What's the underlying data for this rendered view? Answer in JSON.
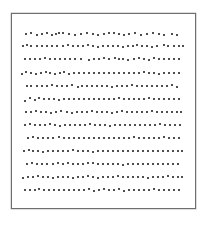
{
  "figure": {
    "frame": {
      "left": 11,
      "top": 13,
      "width": 183,
      "height": 194,
      "border_color": "#6e6e6e"
    },
    "dot_color": "#2b2b2b",
    "row_count": 13,
    "row_y": [
      33,
      45,
      58,
      72,
      85,
      98,
      111,
      124,
      137,
      150,
      163,
      176,
      189
    ],
    "rows": [
      {
        "x": [
          25,
          30,
          36,
          41,
          46,
          51,
          55,
          58,
          62,
          68,
          74,
          80,
          86,
          92,
          97,
          103,
          108,
          113,
          118,
          123,
          128,
          134,
          140,
          146,
          152,
          158,
          163,
          171,
          176
        ],
        "dy": [
          0,
          -1,
          1,
          0,
          -1,
          1,
          0,
          -1,
          -1,
          0,
          1,
          0,
          -1,
          0,
          1,
          0,
          -1,
          -1,
          0,
          1,
          0,
          -1,
          1,
          0,
          -1,
          0,
          1,
          0,
          1
        ]
      },
      {
        "x": [
          22,
          26,
          30,
          36,
          41,
          46,
          51,
          56,
          62,
          67,
          72,
          77,
          82,
          87,
          92,
          97,
          102,
          107,
          112,
          117,
          122,
          127,
          132,
          136,
          141,
          146,
          151,
          156,
          163,
          167,
          173,
          178,
          182
        ],
        "dy": [
          0,
          -1,
          0,
          0,
          0,
          0,
          0,
          0,
          0,
          -1,
          0,
          0,
          0,
          -1,
          0,
          1,
          0,
          0,
          0,
          0,
          1,
          0,
          0,
          -1,
          0,
          0,
          1,
          0,
          -1,
          0,
          0,
          0,
          0
        ]
      },
      {
        "x": [
          24,
          29,
          34,
          39,
          44,
          49,
          54,
          59,
          64,
          69,
          74,
          80,
          88,
          93,
          98,
          103,
          108,
          114,
          118,
          122,
          127,
          133,
          138,
          143,
          148,
          153,
          158,
          163,
          168,
          173,
          178
        ],
        "dy": [
          0,
          0,
          0,
          0,
          -1,
          0,
          0,
          0,
          0,
          0,
          0,
          0,
          1,
          0,
          0,
          -1,
          0,
          -1,
          0,
          0,
          1,
          0,
          -1,
          0,
          1,
          -1,
          0,
          0,
          0,
          0,
          0
        ]
      },
      {
        "x": [
          21,
          25,
          30,
          35,
          40,
          45,
          49,
          54,
          59,
          63,
          68,
          73,
          78,
          83,
          88,
          93,
          98,
          103,
          108,
          113,
          118,
          123,
          128,
          133,
          138,
          143,
          148,
          153,
          158,
          163,
          168,
          173,
          178
        ],
        "dy": [
          1,
          -1,
          0,
          1,
          0,
          -1,
          0,
          1,
          0,
          -1,
          1,
          0,
          0,
          0,
          0,
          0,
          0,
          0,
          0,
          0,
          0,
          0,
          0,
          0,
          0,
          -1,
          0,
          0,
          1,
          0,
          0,
          0,
          0
        ]
      },
      {
        "x": [
          26,
          30,
          36,
          41,
          46,
          51,
          56,
          61,
          66,
          71,
          77,
          81,
          86,
          91,
          96,
          101,
          106,
          111,
          116,
          121,
          126,
          131,
          136,
          141,
          146,
          151,
          156,
          161,
          166,
          171,
          176
        ],
        "dy": [
          0,
          0,
          0,
          0,
          0,
          -1,
          0,
          0,
          0,
          -1,
          1,
          0,
          0,
          0,
          0,
          0,
          0,
          1,
          0,
          0,
          0,
          -1,
          0,
          0,
          0,
          0,
          0,
          0,
          0,
          -1,
          1
        ]
      },
      {
        "x": [
          24,
          29,
          34,
          38,
          43,
          48,
          53,
          58,
          63,
          68,
          73,
          78,
          83,
          88,
          93,
          98,
          103,
          108,
          113,
          118,
          123,
          128,
          133,
          138,
          143,
          148,
          153,
          158,
          163,
          168,
          173,
          178
        ],
        "dy": [
          2,
          -1,
          1,
          -1,
          0,
          0,
          0,
          1,
          0,
          0,
          0,
          0,
          0,
          0,
          0,
          0,
          0,
          0,
          0,
          -1,
          0,
          0,
          0,
          0,
          0,
          -1,
          0,
          0,
          0,
          0,
          0,
          0
        ]
      },
      {
        "x": [
          25,
          30,
          35,
          40,
          45,
          50,
          55,
          60,
          66,
          71,
          76,
          81,
          86,
          91,
          96,
          101,
          106,
          111,
          116,
          121,
          126,
          131,
          136,
          141,
          146,
          151,
          156,
          161,
          166,
          171,
          176,
          180
        ],
        "dy": [
          0,
          0,
          -1,
          0,
          0,
          1,
          0,
          -1,
          0,
          1,
          0,
          0,
          0,
          -1,
          0,
          0,
          0,
          1,
          0,
          -1,
          0,
          0,
          0,
          0,
          0,
          -1,
          0,
          0,
          0,
          0,
          0,
          0
        ]
      },
      {
        "x": [
          24,
          29,
          34,
          39,
          44,
          49,
          54,
          59,
          64,
          69,
          74,
          79,
          84,
          89,
          94,
          99,
          104,
          109,
          114,
          119,
          124,
          129,
          134,
          139,
          144,
          149,
          154,
          159,
          164,
          169,
          174,
          179
        ],
        "dy": [
          0,
          -1,
          0,
          0,
          0,
          -1,
          0,
          1,
          0,
          0,
          0,
          0,
          0,
          -1,
          0,
          0,
          0,
          1,
          0,
          0,
          0,
          0,
          0,
          0,
          0,
          0,
          0,
          -1,
          0,
          0,
          0,
          0
        ]
      },
      {
        "x": [
          27,
          32,
          37,
          42,
          47,
          52,
          58,
          63,
          68,
          73,
          78,
          83,
          88,
          93,
          98,
          103,
          108,
          113,
          118,
          123,
          128,
          133,
          138,
          143,
          148,
          153,
          158,
          163,
          168,
          173,
          178
        ],
        "dy": [
          0,
          -1,
          0,
          0,
          0,
          0,
          -1,
          0,
          0,
          0,
          0,
          0,
          0,
          0,
          0,
          0,
          0,
          0,
          0,
          0,
          0,
          -1,
          0,
          0,
          0,
          0,
          0,
          -1,
          0,
          0,
          0
        ]
      },
      {
        "x": [
          23,
          28,
          32,
          37,
          42,
          47,
          52,
          57,
          62,
          67,
          72,
          77,
          82,
          87,
          92,
          97,
          102,
          107,
          112,
          117,
          122,
          127,
          132,
          137,
          142,
          147,
          152,
          157,
          162,
          167,
          172,
          177,
          181
        ],
        "dy": [
          0,
          -1,
          0,
          0,
          1,
          0,
          0,
          0,
          0,
          0,
          -1,
          0,
          0,
          0,
          1,
          0,
          0,
          0,
          0,
          0,
          0,
          0,
          0,
          0,
          0,
          0,
          0,
          0,
          0,
          0,
          0,
          0,
          0
        ]
      },
      {
        "x": [
          26,
          31,
          36,
          41,
          46,
          52,
          57,
          62,
          67,
          72,
          77,
          82,
          87,
          92,
          97,
          102,
          107,
          112,
          117,
          122,
          127,
          132,
          137,
          142,
          147,
          152,
          157,
          162,
          167,
          172,
          177
        ],
        "dy": [
          0,
          -1,
          0,
          0,
          0,
          0,
          -1,
          0,
          -1,
          0,
          0,
          0,
          -1,
          -1,
          0,
          0,
          0,
          0,
          0,
          1,
          0,
          0,
          0,
          0,
          0,
          0,
          0,
          0,
          0,
          0,
          0
        ]
      },
      {
        "x": [
          22,
          27,
          32,
          37,
          42,
          47,
          52,
          57,
          62,
          67,
          72,
          77,
          82,
          87,
          92,
          97,
          102,
          107,
          112,
          117,
          122,
          127,
          132,
          137,
          142,
          147,
          152,
          157,
          162,
          167,
          172,
          177,
          181
        ],
        "dy": [
          1,
          0,
          0,
          -1,
          0,
          0,
          1,
          0,
          0,
          0,
          1,
          0,
          0,
          -1,
          0,
          1,
          0,
          0,
          0,
          -1,
          0,
          0,
          0,
          0,
          0,
          1,
          0,
          0,
          0,
          -1,
          0,
          0,
          0
        ]
      },
      {
        "x": [
          24,
          29,
          34,
          38,
          43,
          48,
          53,
          58,
          63,
          68,
          73,
          78,
          83,
          88,
          93,
          98,
          103,
          108,
          113,
          118,
          123,
          128,
          133,
          138,
          143,
          148,
          153,
          158,
          163,
          168,
          173,
          178
        ],
        "dy": [
          0,
          0,
          0,
          -1,
          0,
          0,
          0,
          0,
          0,
          0,
          0,
          0,
          0,
          -1,
          1,
          0,
          -1,
          0,
          0,
          -1,
          1,
          0,
          0,
          0,
          0,
          0,
          -1,
          0,
          0,
          0,
          0,
          0
        ]
      }
    ]
  }
}
